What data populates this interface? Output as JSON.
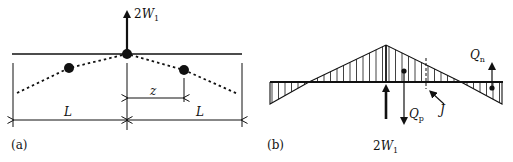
{
  "figure": {
    "panels": [
      {
        "id": "a",
        "caption": "(a)",
        "force_label": {
          "coef": "2",
          "var": "W",
          "sub": "1"
        },
        "dimension_z": "z",
        "dimension_L_left": "L",
        "dimension_L_right": "L"
      },
      {
        "id": "b",
        "caption": "(b)",
        "force_label": {
          "coef": "2",
          "var": "W",
          "sub": "1"
        },
        "Qn": {
          "var": "Q",
          "sub": "n"
        },
        "Qp": {
          "var": "Q",
          "sub": "p"
        },
        "J": "J"
      }
    ],
    "colors": {
      "ink": "#111111",
      "background": "#ffffff"
    }
  }
}
